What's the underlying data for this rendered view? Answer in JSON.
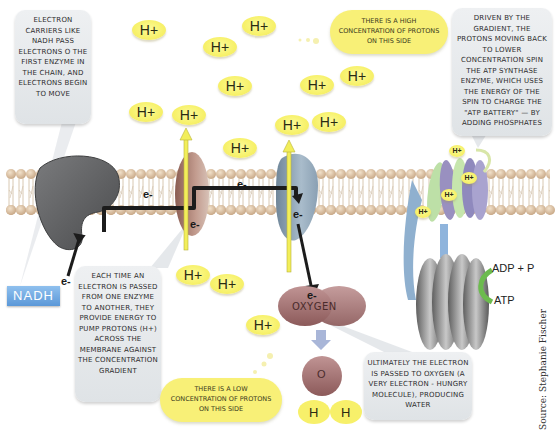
{
  "diagram": {
    "callouts": {
      "nadh_carriers": "Electron carriers like NADH pass electrons o the first enzyme in the chain, and electrons begin to move",
      "high_concentration": "There is a high concentration of protons on this side",
      "atp_synthase": "Driven by the gradient, the protons moving back to lower concentration spin the ATP synthase enzyme, which uses the energy of the spin to charge the \"ATP battery\" — by adding phosphates",
      "proton_pumping": "Each time an electron is passed from one enzyme to another, they provide energy to pump protons (H+) across the membrane against the concentration gradient",
      "low_concentration": "There is a low concentration of protons on this side",
      "oxygen_water": "Ultimately the electron is passed to oxygen (a very electron - hungry molecule), producing water"
    },
    "labels": {
      "nadh": "NADH",
      "electron": "e-",
      "proton": "H+",
      "oxygen": "Oxygen",
      "water_o": "O",
      "water_h": "H",
      "adp_p": "ADP + P",
      "atp": "ATP"
    },
    "source": "Source: Stephanie Fischer",
    "colors": {
      "proton_yellow": "#f7f16a",
      "membrane_tan": "#d9c2a3",
      "nadh_blue": "#6aa6e2",
      "enzyme1_gray": "#5f6062",
      "enzyme2_brown": "#a67a6e",
      "enzyme3_blue": "#8ea4b8",
      "oxygen_mauve": "#9c6868",
      "atp_arc_green": "#6cbb4e"
    }
  }
}
